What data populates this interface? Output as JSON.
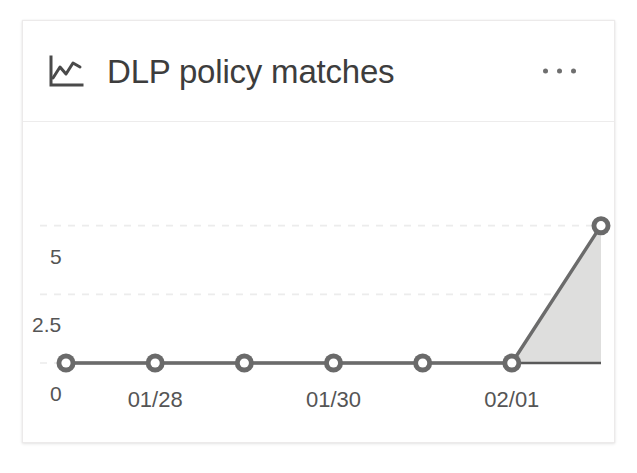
{
  "card": {
    "title": "DLP policy matches",
    "icon": "line-chart-icon",
    "overflow_menu": "…",
    "background_color": "#ffffff",
    "border_color": "#eceaea"
  },
  "chart_data": {
    "type": "area",
    "title": "DLP policy matches",
    "xlabel": "",
    "ylabel": "",
    "grid": true,
    "legend": false,
    "ylim": [
      0,
      7.5
    ],
    "yticks": [
      0,
      2.5,
      5
    ],
    "ytick_labels": [
      "0",
      "2.5",
      "5"
    ],
    "x": [
      "01/27",
      "01/28",
      "01/29",
      "01/30",
      "01/31",
      "02/01",
      "02/02"
    ],
    "xtick_labels": [
      "",
      "01/28",
      "",
      "01/30",
      "",
      "02/01",
      ""
    ],
    "categories": [
      "01/27",
      "01/28",
      "01/29",
      "01/30",
      "01/31",
      "02/01",
      "02/02"
    ],
    "series": [
      {
        "name": "DLP policy matches",
        "values": [
          0,
          0,
          0,
          0,
          0,
          0,
          5
        ],
        "line_color": "#6b6b6b",
        "area_color": "#dededd",
        "marker_color": "#6a6a6a"
      }
    ]
  },
  "colors": {
    "gridline": "#ececec",
    "axis": "#595959",
    "text": "#3d3d3d",
    "tick_text": "#555555"
  }
}
